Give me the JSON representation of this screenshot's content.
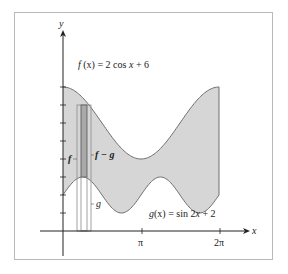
{
  "chart_data": {
    "type": "area",
    "title": "",
    "xlabel": "x",
    "ylabel": "y",
    "x_ticks": [
      "π",
      "2π"
    ],
    "xlim": [
      0,
      6.2832
    ],
    "ylim": [
      0,
      8
    ],
    "y_tick_count": 8,
    "grid": false,
    "series": [
      {
        "name": "f(x) = 2 cos x + 6",
        "formula": "2*cos(x)+6",
        "x": [
          0,
          0.785,
          1.571,
          2.356,
          3.1416,
          3.927,
          4.712,
          5.498,
          6.2832
        ],
        "values": [
          8,
          7.41,
          6,
          4.59,
          4,
          4.59,
          6,
          7.41,
          8
        ]
      },
      {
        "name": "g(x) = sin 2x + 2",
        "formula": "sin(2*x)+2",
        "x": [
          0,
          0.785,
          1.571,
          2.356,
          3.1416,
          3.927,
          4.712,
          5.498,
          6.2832
        ],
        "values": [
          2,
          3,
          2,
          1,
          2,
          3,
          2,
          1,
          2
        ]
      }
    ],
    "shaded_region": "between f and g on [0, 2π]",
    "annotations": [
      "f",
      "f − g",
      "g"
    ],
    "representative_rectangle": {
      "x": 0.785,
      "from": "g(x)",
      "to": "f(x)"
    }
  },
  "labels": {
    "f_eq_prefix": "f",
    "f_eq_arg": "(x)",
    "f_eq_rest": " = 2 cos ",
    "f_eq_var": "x",
    "f_eq_tail": " + 6",
    "g_eq_prefix": "g",
    "g_eq_arg": "(x)",
    "g_eq_rest": " = sin 2",
    "g_eq_var": "x",
    "g_eq_tail": " + 2",
    "f_rect": "f",
    "fg_rect": "f − g",
    "g_rect": "g",
    "x_axis": "x",
    "y_axis": "y",
    "pi": "π",
    "two_pi": "2π"
  },
  "colors": {
    "fill": "#d6d6d6",
    "curve": "#6e6e6e",
    "axis": "#222222",
    "rect_dark": "#a9a9a9"
  }
}
